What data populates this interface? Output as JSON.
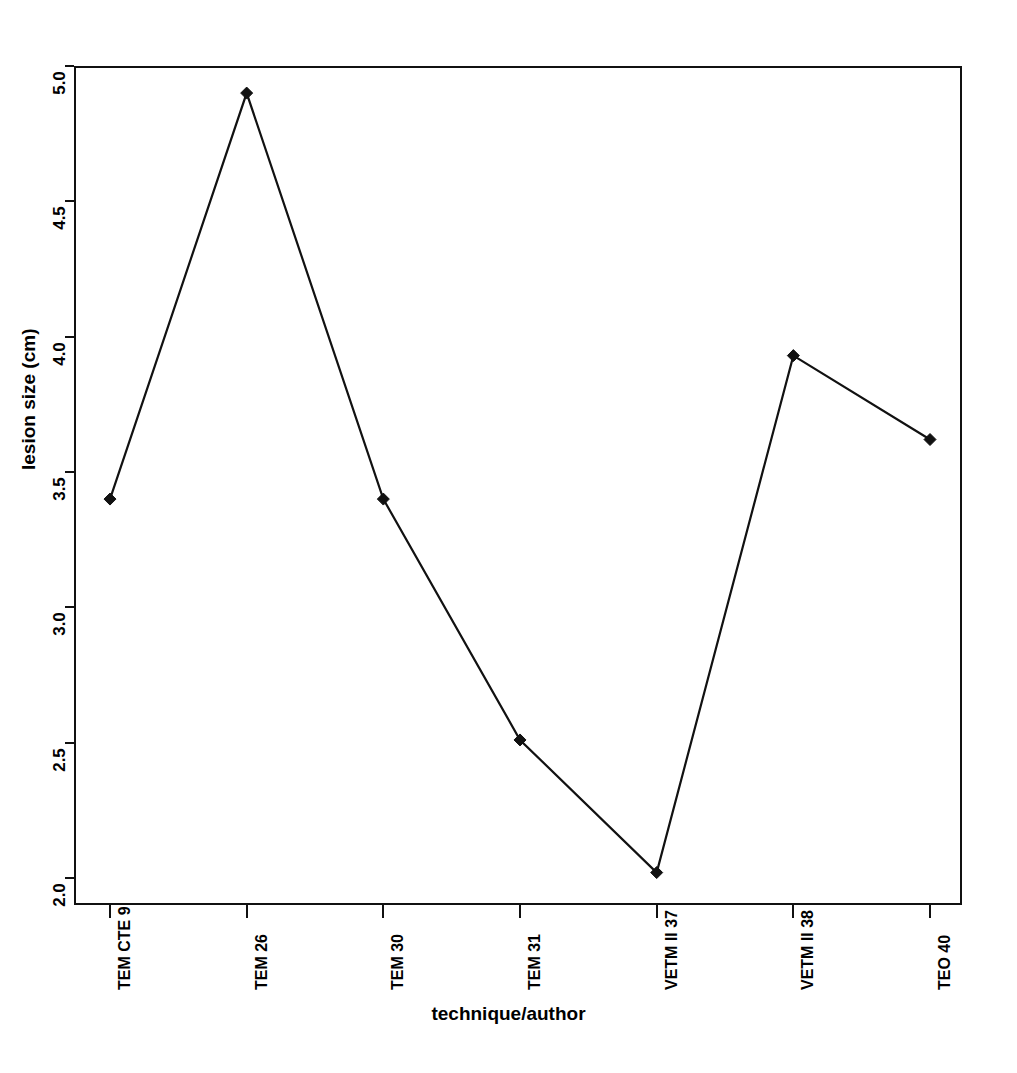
{
  "chart_data": {
    "type": "line",
    "title": "",
    "subtitle": "",
    "xlabel": "technique/author",
    "ylabel": "lesion size (cm)",
    "categories": [
      "TEM CTE 9",
      "TEM 26",
      "TEM 30",
      "TEM 31",
      "VETM II 37",
      "VETM II 38",
      "TEO 40"
    ],
    "values": [
      3.4,
      4.9,
      3.4,
      2.51,
      2.02,
      3.93,
      3.62
    ],
    "series": [
      {
        "name": "lesion size",
        "values": [
          3.4,
          4.9,
          3.4,
          2.51,
          2.02,
          3.93,
          3.62
        ]
      }
    ],
    "ylim": [
      2.0,
      5.0
    ],
    "ytick_labels": [
      "2.0",
      "2.5",
      "3.0",
      "3.5",
      "4.0",
      "4.5",
      "5.0"
    ],
    "ytick_values": [
      2.0,
      2.5,
      3.0,
      3.5,
      4.0,
      4.5,
      5.0
    ],
    "grid": false,
    "legend": "none",
    "marker": "diamond",
    "line_color": "#111111",
    "marker_color": "#111111",
    "background_color": "#ffffff",
    "frame_color": "#111111"
  }
}
